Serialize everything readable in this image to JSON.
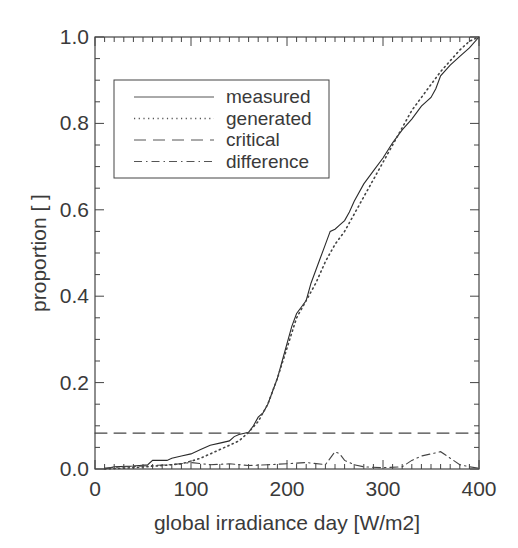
{
  "chart_data": {
    "type": "line",
    "title": "",
    "xlabel": "global irradiance day [W/m2]",
    "ylabel": "proportion [ ]",
    "xlim": [
      0,
      400
    ],
    "ylim": [
      0.0,
      1.0
    ],
    "xticks": [
      "0",
      "100",
      "200",
      "300",
      "400"
    ],
    "yticks": [
      "0.0",
      "0.2",
      "0.4",
      "0.6",
      "0.8",
      "1.0"
    ],
    "grid": false,
    "legend_position": "upper left",
    "legend": [
      "measured",
      "generated",
      "critical",
      "difference"
    ],
    "series": [
      {
        "name": "measured",
        "style": "solid",
        "x": [
          10,
          20,
          40,
          55,
          60,
          75,
          80,
          90,
          100,
          110,
          120,
          130,
          140,
          145,
          150,
          160,
          165,
          170,
          175,
          180,
          185,
          190,
          195,
          200,
          205,
          210,
          215,
          220,
          225,
          230,
          235,
          240,
          245,
          250,
          255,
          260,
          265,
          270,
          280,
          290,
          300,
          310,
          320,
          330,
          340,
          350,
          355,
          360,
          370,
          380,
          390,
          400
        ],
        "y": [
          0.0,
          0.005,
          0.007,
          0.01,
          0.02,
          0.02,
          0.025,
          0.03,
          0.035,
          0.045,
          0.055,
          0.06,
          0.065,
          0.075,
          0.08,
          0.085,
          0.1,
          0.12,
          0.13,
          0.15,
          0.18,
          0.21,
          0.25,
          0.29,
          0.33,
          0.36,
          0.375,
          0.39,
          0.43,
          0.46,
          0.49,
          0.52,
          0.55,
          0.555,
          0.565,
          0.575,
          0.595,
          0.62,
          0.66,
          0.69,
          0.72,
          0.755,
          0.785,
          0.81,
          0.84,
          0.86,
          0.88,
          0.91,
          0.935,
          0.955,
          0.975,
          1.0
        ]
      },
      {
        "name": "generated",
        "style": "dotted",
        "x": [
          10,
          40,
          70,
          90,
          100,
          110,
          120,
          130,
          140,
          150,
          160,
          170,
          180,
          190,
          200,
          210,
          220,
          230,
          240,
          250,
          260,
          270,
          280,
          290,
          300,
          310,
          320,
          330,
          340,
          350,
          360,
          370,
          380,
          390,
          400
        ],
        "y": [
          0.0,
          0.003,
          0.008,
          0.012,
          0.018,
          0.025,
          0.035,
          0.045,
          0.055,
          0.065,
          0.085,
          0.11,
          0.15,
          0.21,
          0.28,
          0.35,
          0.39,
          0.43,
          0.48,
          0.52,
          0.55,
          0.59,
          0.63,
          0.67,
          0.71,
          0.75,
          0.79,
          0.83,
          0.86,
          0.89,
          0.92,
          0.945,
          0.97,
          0.99,
          1.0
        ]
      },
      {
        "name": "critical",
        "style": "dashed",
        "x": [
          0,
          400
        ],
        "y": [
          0.083,
          0.083
        ]
      },
      {
        "name": "difference",
        "style": "dashdot",
        "x": [
          10,
          30,
          60,
          80,
          100,
          120,
          140,
          160,
          180,
          200,
          220,
          240,
          250,
          255,
          260,
          270,
          280,
          300,
          320,
          330,
          340,
          350,
          360,
          370,
          380,
          390,
          400
        ],
        "y": [
          0.002,
          0.005,
          0.008,
          0.01,
          0.015,
          0.01,
          0.012,
          0.008,
          0.01,
          0.012,
          0.015,
          0.01,
          0.04,
          0.035,
          0.02,
          0.01,
          0.005,
          0.003,
          0.005,
          0.02,
          0.03,
          0.035,
          0.04,
          0.025,
          0.01,
          0.005,
          0.002
        ]
      }
    ]
  }
}
